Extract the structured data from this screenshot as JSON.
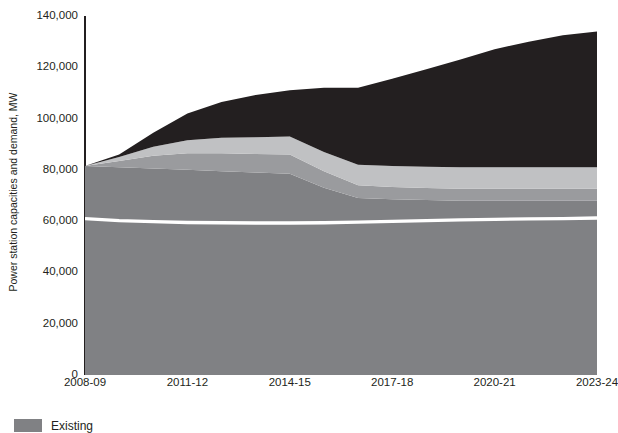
{
  "chart_data": {
    "type": "area",
    "title": "",
    "xlabel": "",
    "ylabel": "Power station capacities and demand, MW",
    "ylim": [
      0,
      140000
    ],
    "ytick_values": [
      0,
      20000,
      40000,
      60000,
      80000,
      100000,
      120000,
      140000
    ],
    "ytick_labels": [
      "0",
      "20,000",
      "40,000",
      "60,000",
      "80,000",
      "100,000",
      "120,000",
      "140,000"
    ],
    "grid": false,
    "legend_position": "below-left",
    "stacked": true,
    "x": [
      "2008-09",
      "2009-10",
      "2010-11",
      "2011-12",
      "2012-13",
      "2013-14",
      "2014-15",
      "2015-16",
      "2016-17",
      "2017-18",
      "2018-19",
      "2019-20",
      "2020-21",
      "2021-22",
      "2022-23",
      "2023-24"
    ],
    "xtick_labels": [
      "2008-09",
      "2011-12",
      "2014-15",
      "2017-18",
      "2020-21",
      "2023-24"
    ],
    "series": [
      {
        "name": "Existing",
        "color": "#808184",
        "values": [
          81500,
          81000,
          80500,
          80000,
          79500,
          79000,
          78500,
          73000,
          69000,
          68500,
          68200,
          68000,
          68000,
          68000,
          68000,
          68000
        ]
      },
      {
        "name": "Band 2",
        "color": "#9a9b9e",
        "values": [
          0,
          2500,
          5000,
          6500,
          7000,
          7200,
          7500,
          6500,
          5000,
          4800,
          4700,
          4600,
          4600,
          4600,
          4600,
          4600
        ]
      },
      {
        "name": "Band 3",
        "color": "#c0c1c3",
        "values": [
          0,
          1500,
          3500,
          5000,
          6000,
          6500,
          7000,
          7500,
          8000,
          8200,
          8300,
          8400,
          8400,
          8400,
          8400,
          8400
        ]
      },
      {
        "name": "Band 4",
        "color": "#231f20",
        "values": [
          0,
          1000,
          5500,
          10500,
          14000,
          16500,
          18000,
          25000,
          30000,
          34000,
          38000,
          42000,
          46000,
          49000,
          51500,
          53000
        ]
      }
    ],
    "demand_line": {
      "name": "Demand",
      "color": "#ffffff",
      "values": [
        61000,
        60200,
        59800,
        59500,
        59400,
        59300,
        59300,
        59400,
        59600,
        59900,
        60200,
        60500,
        60700,
        60900,
        61000,
        61200
      ]
    }
  },
  "legend": {
    "items": [
      {
        "label": "Existing",
        "color": "#808184"
      }
    ]
  }
}
